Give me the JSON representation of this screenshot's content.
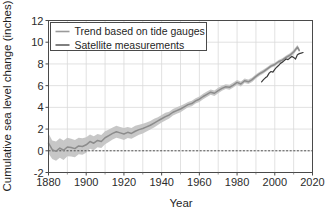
{
  "chart_data": {
    "type": "line",
    "title": "",
    "subtitle": "",
    "xlabel": "Year",
    "ylabel": "Cumulative sea level change (inches)",
    "xlim": [
      1880,
      2020
    ],
    "ylim": [
      -2,
      12
    ],
    "xticks": [
      1880,
      1900,
      1920,
      1940,
      1960,
      1980,
      2000,
      2020
    ],
    "xtick_labels": [
      "1880",
      "1900",
      "1920",
      "1940",
      "1960",
      "1980",
      "2000",
      "2020"
    ],
    "yticks": [
      -2,
      0,
      2,
      4,
      6,
      8,
      10,
      12
    ],
    "ytick_labels": [
      "-2",
      "0",
      "2",
      "4",
      "6",
      "8",
      "10",
      "12"
    ],
    "x_minor_ticks": [
      1890,
      1910,
      1930,
      1950,
      1970,
      1990,
      2010
    ],
    "grid": true,
    "grid_color": "#d9d9d9",
    "reference_line": {
      "value": 0,
      "style": "dashed",
      "color": "#404040"
    },
    "legend": {
      "position": "upper-left",
      "entries": [
        {
          "label": "Trend based on tide gauges",
          "color": "#9a9a9a",
          "marker": "line"
        },
        {
          "label": "Satellite measurements",
          "color": "#3a3a3a",
          "marker": "line"
        }
      ]
    },
    "series": [
      {
        "name": "Trend based on tide gauges",
        "color": "#8c8c8c",
        "band_color": "#c4c4c4",
        "x": [
          1880,
          1882,
          1884,
          1886,
          1888,
          1890,
          1892,
          1894,
          1896,
          1898,
          1900,
          1902,
          1904,
          1906,
          1908,
          1910,
          1912,
          1914,
          1916,
          1918,
          1920,
          1922,
          1924,
          1926,
          1928,
          1930,
          1932,
          1934,
          1936,
          1938,
          1940,
          1942,
          1944,
          1946,
          1948,
          1950,
          1952,
          1954,
          1956,
          1958,
          1960,
          1962,
          1964,
          1966,
          1968,
          1970,
          1972,
          1974,
          1976,
          1978,
          1980,
          1982,
          1984,
          1986,
          1988,
          1990,
          1992,
          1994,
          1996,
          1998,
          2000,
          2002,
          2004,
          2006,
          2008,
          2010,
          2012,
          2013
        ],
        "values": [
          0.7,
          0.1,
          -0.05,
          0.25,
          0.05,
          0.35,
          0.3,
          0.2,
          0.45,
          0.4,
          0.55,
          0.85,
          0.7,
          0.95,
          0.85,
          1.2,
          1.4,
          1.6,
          1.75,
          1.65,
          1.55,
          1.7,
          1.6,
          1.8,
          1.95,
          2.05,
          2.2,
          2.35,
          2.55,
          2.75,
          2.95,
          3.15,
          3.3,
          3.55,
          3.7,
          3.85,
          4.05,
          4.25,
          4.35,
          4.6,
          4.75,
          5.0,
          5.2,
          5.4,
          5.3,
          5.55,
          5.75,
          5.9,
          5.85,
          6.05,
          6.3,
          6.15,
          6.45,
          6.35,
          6.55,
          6.85,
          7.1,
          7.3,
          7.55,
          7.8,
          7.95,
          8.2,
          8.35,
          8.6,
          8.8,
          9.1,
          9.55,
          9.25
        ],
        "band_upper": [
          1.6,
          0.95,
          0.85,
          1.15,
          0.95,
          1.2,
          1.1,
          1.0,
          1.2,
          1.15,
          1.25,
          1.5,
          1.35,
          1.55,
          1.45,
          1.8,
          1.95,
          2.15,
          2.3,
          2.2,
          2.1,
          2.2,
          2.1,
          2.3,
          2.4,
          2.5,
          2.6,
          2.75,
          2.95,
          3.1,
          3.3,
          3.5,
          3.6,
          3.85,
          4.0,
          4.15,
          4.3,
          4.5,
          4.6,
          4.85,
          5.0,
          5.25,
          5.45,
          5.65,
          5.55,
          5.8,
          5.98,
          6.12,
          6.08,
          6.28,
          6.52,
          6.38,
          6.66,
          6.56,
          6.76,
          7.05,
          7.28,
          7.48,
          7.72,
          7.96,
          8.12,
          8.36,
          8.52,
          8.78,
          8.98,
          9.3,
          9.75,
          9.45
        ],
        "band_lower": [
          -0.25,
          -0.75,
          -0.92,
          -0.65,
          -0.85,
          -0.5,
          -0.52,
          -0.6,
          -0.32,
          -0.36,
          -0.18,
          0.18,
          0.05,
          0.32,
          0.25,
          0.6,
          0.82,
          1.05,
          1.2,
          1.1,
          1.0,
          1.18,
          1.1,
          1.3,
          1.48,
          1.6,
          1.78,
          1.95,
          2.15,
          2.38,
          2.6,
          2.8,
          2.98,
          3.25,
          3.4,
          3.55,
          3.78,
          4.0,
          4.1,
          4.35,
          4.5,
          4.75,
          4.95,
          5.15,
          5.05,
          5.3,
          5.52,
          5.68,
          5.62,
          5.82,
          6.08,
          5.92,
          6.24,
          6.14,
          6.34,
          6.65,
          6.92,
          7.12,
          7.38,
          7.64,
          7.78,
          8.04,
          8.18,
          8.42,
          8.62,
          8.9,
          9.35,
          9.05
        ]
      },
      {
        "name": "Satellite measurements",
        "color": "#3a3a3a",
        "x": [
          1993,
          1994,
          1995,
          1996,
          1997,
          1998,
          1999,
          2000,
          2001,
          2002,
          2003,
          2004,
          2005,
          2006,
          2007,
          2008,
          2009,
          2010,
          2011,
          2012,
          2013,
          2014,
          2015
        ],
        "values": [
          6.35,
          6.55,
          6.72,
          6.85,
          7.15,
          7.3,
          7.25,
          7.5,
          7.7,
          7.85,
          8.05,
          8.15,
          8.3,
          8.45,
          8.4,
          8.55,
          8.7,
          8.6,
          8.45,
          8.85,
          8.95,
          9.0,
          9.05
        ]
      }
    ]
  }
}
